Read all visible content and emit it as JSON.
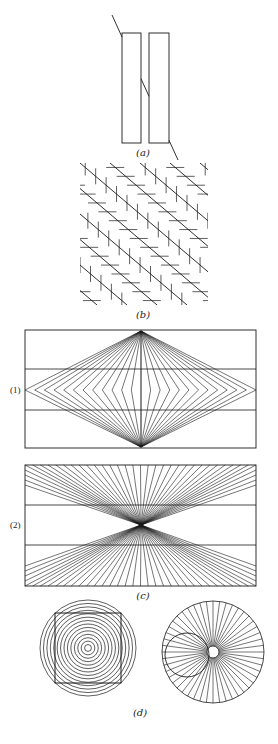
{
  "figure": {
    "ink_color": "#1a1a1a",
    "panels": {
      "a": {
        "label": "(a)",
        "label_pos": [
          143,
          156
        ],
        "rects": [
          [
            122,
            33,
            19,
            110
          ],
          [
            149,
            33,
            20,
            110
          ]
        ],
        "transversal": [
          [
            112,
            15
          ],
          [
            178,
            160
          ]
        ]
      },
      "b": {
        "label": "(b)",
        "label_pos": [
          143,
          318
        ],
        "bounds": [
          80,
          163,
          128,
          142
        ]
      },
      "c": {
        "label": "(c)",
        "label_pos": [
          143,
          599
        ],
        "sub1": {
          "label": "(1)",
          "label_pos": [
            10,
            393
          ],
          "box": [
            25,
            330,
            231,
            118
          ],
          "hlines": [
            369,
            410
          ],
          "apex_top": [
            141,
            331
          ],
          "apex_bottom": [
            141,
            447
          ],
          "mid_y": 390,
          "fan_count": 12
        },
        "sub2": {
          "label": "(2)",
          "label_pos": [
            10,
            528
          ],
          "box": [
            25,
            465,
            231,
            121
          ],
          "hlines": [
            505,
            545
          ],
          "center": [
            141,
            525
          ],
          "fan_count": 30
        }
      },
      "d": {
        "label": "(d)",
        "label_pos": [
          140,
          716
        ],
        "concentric": {
          "center": [
            88,
            648
          ],
          "outer_radius": 48,
          "ring_count": 14,
          "square": [
            55,
            613,
            66,
            70
          ]
        },
        "radial": {
          "center": [
            213,
            652
          ],
          "radius": 51,
          "hole_radius": 6,
          "spoke_count": 48,
          "small_circle": [
            187,
            655,
            22
          ]
        }
      }
    }
  }
}
